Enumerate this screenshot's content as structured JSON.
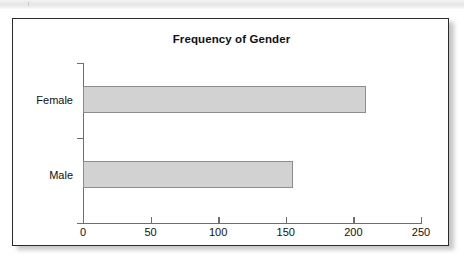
{
  "figure": {
    "title": "Frequency of Gender"
  },
  "chart_data": {
    "type": "bar",
    "orientation": "horizontal",
    "title": "Frequency of Gender",
    "xlabel": "",
    "ylabel": "",
    "categories": [
      "Male",
      "Female"
    ],
    "values": [
      155,
      209
    ],
    "xlim": [
      0,
      250
    ],
    "xticks": [
      "0",
      "50",
      "100",
      "150",
      "200",
      "250"
    ],
    "grid": false,
    "legend": false,
    "bar_fill_color": "#d2d2d2",
    "bar_border_color": "#8d8d8d",
    "axis_color": "#6e6e6e",
    "frame_color": "#2b2b2b"
  }
}
